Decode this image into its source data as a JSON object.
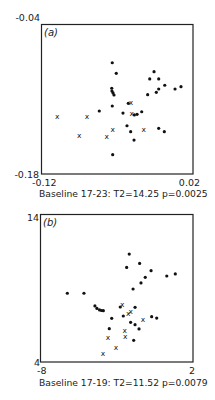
{
  "chart_data": [
    {
      "type": "scatter",
      "panel_label": "(a)",
      "title": "",
      "caption": "Baseline 17-23:  T2=14.25 p=0.0025",
      "xlabel": "",
      "ylabel": "",
      "xlim": [
        -0.12,
        0.02
      ],
      "ylim": [
        -0.18,
        -0.04
      ],
      "x_tick_labels": [
        "-0.12",
        "0.02"
      ],
      "y_tick_labels": [
        "-0.18",
        "-0.04"
      ],
      "grid": false,
      "series": [
        {
          "name": "dots",
          "marker": "dot",
          "points": [
            [
              -0.0546,
              -0.0758
            ],
            [
              -0.0509,
              -0.0857
            ],
            [
              -0.0551,
              -0.0997
            ],
            [
              -0.0549,
              -0.1023
            ],
            [
              -0.0539,
              -0.1041
            ],
            [
              -0.053,
              -0.106
            ],
            [
              -0.0546,
              -0.1163
            ],
            [
              -0.0666,
              -0.121
            ],
            [
              -0.0542,
              -0.1619
            ],
            [
              -0.016,
              -0.0842
            ],
            [
              -0.02,
              -0.091
            ],
            [
              -0.0117,
              -0.091
            ],
            [
              -0.0061,
              -0.0969
            ],
            [
              -0.0117,
              -0.1004
            ],
            [
              -0.0139,
              -0.1035
            ],
            [
              0.0034,
              -0.1004
            ],
            [
              0.0089,
              -0.0982
            ],
            [
              -0.0219,
              -0.1057
            ],
            [
              -0.0398,
              -0.1138
            ],
            [
              -0.0447,
              -0.1229
            ],
            [
              -0.0342,
              -0.1247
            ],
            [
              -0.0317,
              -0.1241
            ],
            [
              -0.0274,
              -0.1217
            ],
            [
              -0.041,
              -0.1348
            ],
            [
              -0.0376,
              -0.1404
            ],
            [
              -0.0117,
              -0.1372
            ],
            [
              -0.0065,
              -0.1404
            ],
            [
              -0.0345,
              -0.1482
            ]
          ]
        },
        {
          "name": "crosses",
          "marker": "x",
          "points": [
            [
              -0.1054,
              -0.1257
            ],
            [
              -0.078,
              -0.1257
            ],
            [
              -0.0542,
              -0.1379
            ],
            [
              -0.0851,
              -0.1438
            ],
            [
              -0.0597,
              -0.1451
            ],
            [
              -0.0373,
              -0.1126
            ],
            [
              -0.0366,
              -0.1229
            ],
            [
              -0.0256,
              -0.1385
            ]
          ]
        }
      ]
    },
    {
      "type": "scatter",
      "panel_label": "(b)",
      "title": "",
      "caption": "Baseline 17-19:  T2=11.52  p=0.0079",
      "xlabel": "",
      "ylabel": "",
      "xlim": [
        -8,
        2
      ],
      "ylim": [
        4,
        14
      ],
      "x_tick_labels": [
        "-8",
        "2"
      ],
      "y_tick_labels": [
        "4",
        "14"
      ],
      "grid": false,
      "series": [
        {
          "name": "dots",
          "marker": "dot",
          "points": [
            [
              -2.18,
              11.32
            ],
            [
              -1.5,
              10.68
            ],
            [
              -2.35,
              10.41
            ],
            [
              -0.75,
              10.19
            ],
            [
              -1.13,
              9.74
            ],
            [
              0.28,
              9.83
            ],
            [
              0.84,
              9.97
            ],
            [
              -1.41,
              9.36
            ],
            [
              -1.93,
              8.95
            ],
            [
              -6.24,
              8.66
            ],
            [
              -5.15,
              8.66
            ],
            [
              -4.43,
              7.8
            ],
            [
              -4.3,
              7.63
            ],
            [
              -4.13,
              7.53
            ],
            [
              -4.0,
              7.49
            ],
            [
              -3.88,
              7.48
            ],
            [
              -2.77,
              7.73
            ],
            [
              -1.8,
              7.71
            ],
            [
              -2.57,
              7.12
            ],
            [
              -3.33,
              6.96
            ],
            [
              -0.71,
              7.07
            ],
            [
              -0.38,
              6.98
            ],
            [
              -2.09,
              6.69
            ],
            [
              -1.8,
              6.53
            ],
            [
              -1.54,
              6.24
            ],
            [
              -3.49,
              6.26
            ],
            [
              -1.89,
              5.47
            ]
          ]
        },
        {
          "name": "crosses",
          "marker": "x",
          "points": [
            [
              -2.64,
              7.93
            ],
            [
              -2.24,
              7.32
            ],
            [
              -2.09,
              7.44
            ],
            [
              -1.28,
              6.89
            ],
            [
              -2.48,
              6.17
            ],
            [
              -2.44,
              5.76
            ],
            [
              -3.57,
              5.65
            ],
            [
              -3.05,
              5.02
            ],
            [
              -3.9,
              4.59
            ]
          ]
        }
      ]
    }
  ]
}
